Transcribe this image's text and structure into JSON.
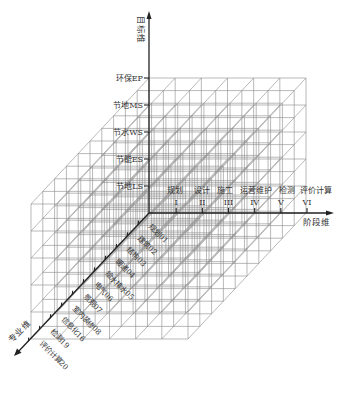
{
  "diagram": {
    "type": "3D morphological (Hall-style) cube diagram",
    "axes": {
      "goal": {
        "label": "目标维",
        "direction": "up"
      },
      "stage": {
        "label": "阶段维",
        "direction": "right"
      },
      "discipline": {
        "label": "专业维",
        "direction": "down-left"
      }
    },
    "goal_levels": [
      {
        "label": "节地LS"
      },
      {
        "label": "节能ES"
      },
      {
        "label": "节水WS"
      },
      {
        "label": "节地MS"
      },
      {
        "label": "环保EP"
      }
    ],
    "stages": [
      {
        "roman": "I",
        "name": "规划"
      },
      {
        "roman": "II",
        "name": "设计"
      },
      {
        "roman": "III",
        "name": "施工"
      },
      {
        "roman": "IV",
        "name": "运营维护"
      },
      {
        "roman": "V",
        "name": "检测"
      },
      {
        "roman": "VI",
        "name": "评价计算"
      }
    ],
    "stage_label_line": "规划   设计   施工运营维护检测评价计算",
    "disciplines": [
      {
        "label": "规划01"
      },
      {
        "label": "建筑02"
      },
      {
        "label": "结构03"
      },
      {
        "label": "暖通04"
      },
      {
        "label": "给水排水05"
      },
      {
        "label": "电气06"
      },
      {
        "label": "景观07"
      },
      {
        "label": "室内装修08"
      },
      {
        "label": "信息化16"
      },
      {
        "label": "检测19"
      },
      {
        "label": "评价计算20"
      }
    ],
    "colors": {
      "axis": "#222222",
      "grid": "#8a8a8a",
      "text": "#333333",
      "background": "#ffffff"
    }
  }
}
